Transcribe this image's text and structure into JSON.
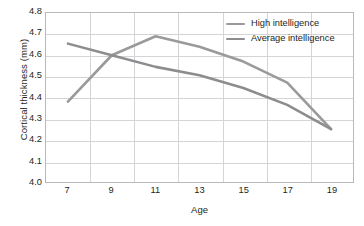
{
  "chart_data": {
    "type": "line",
    "title": "",
    "xlabel": "Age",
    "ylabel": "Cortical thickness (mm)",
    "x": [
      7,
      9,
      11,
      13,
      15,
      17,
      19
    ],
    "categories": [
      "7",
      "9",
      "11",
      "13",
      "15",
      "17",
      "19"
    ],
    "xlim": [
      6,
      20
    ],
    "ylim": [
      4.0,
      4.8
    ],
    "yticks": [
      "4.0",
      "4.1",
      "4.2",
      "4.3",
      "4.4",
      "4.5",
      "4.6",
      "4.7",
      "4.8"
    ],
    "ytick_values": [
      4.0,
      4.1,
      4.2,
      4.3,
      4.4,
      4.5,
      4.6,
      4.7,
      4.8
    ],
    "grid": "both",
    "legend_position": "top-right",
    "series": [
      {
        "name": "High intelligence",
        "color": "#9a9a9c",
        "values": [
          4.38,
          4.6,
          4.69,
          4.64,
          4.57,
          4.47,
          4.25
        ]
      },
      {
        "name": "Average intelligence",
        "color": "#8d8d8f",
        "values": [
          4.655,
          4.6,
          4.545,
          4.505,
          4.445,
          4.365,
          4.25
        ]
      }
    ]
  },
  "legend": {
    "items": [
      {
        "label": "High intelligence"
      },
      {
        "label": "Average intelligence"
      }
    ]
  },
  "axes": {
    "x_title": "Age",
    "y_title": "Cortical thickness (mm)"
  },
  "colors": {
    "series_high": "#9a9a9c",
    "series_average": "#8d8d8f",
    "grid": "#d4d4d6",
    "frame": "#b9b9bb",
    "text": "#231f20",
    "background": "#ffffff"
  }
}
